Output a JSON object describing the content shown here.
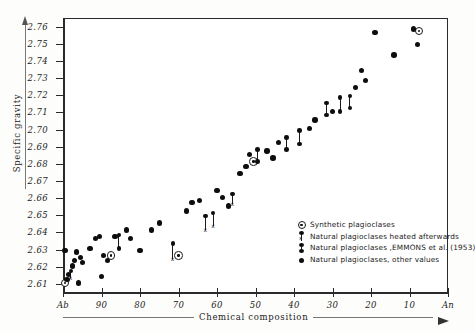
{
  "chart_data": {
    "type": "scatter",
    "title": "",
    "xlabel": "Chemical composition",
    "ylabel": "Specific gravity",
    "x_tick_labels": [
      "Ab",
      "90",
      "80",
      "70",
      "60",
      "50",
      "40",
      "30",
      "20",
      "10",
      "An"
    ],
    "x_tick_values": [
      100,
      90,
      80,
      70,
      60,
      50,
      40,
      30,
      20,
      10,
      0
    ],
    "xlim": [
      100,
      0
    ],
    "x_axis_direction": "decreasing",
    "y_tick_labels": [
      "2.76",
      "2.75",
      "2.74",
      "2.73",
      "2.72",
      "2.71",
      "2.70",
      "2.69",
      "2.68",
      "2.67",
      "2.66",
      "2.65",
      "2.64",
      "2.63",
      "2.62",
      "2.61"
    ],
    "y_tick_values": [
      2.76,
      2.75,
      2.74,
      2.73,
      2.72,
      2.71,
      2.7,
      2.69,
      2.68,
      2.67,
      2.66,
      2.65,
      2.64,
      2.63,
      2.62,
      2.61
    ],
    "ylim": [
      2.605,
      2.765
    ],
    "grid": false,
    "legend_position": "lower-right-inside",
    "legend": [
      {
        "key": "synthetic",
        "label": "Synthetic plagioclases",
        "marker": "open-circle-dot"
      },
      {
        "key": "heated",
        "label": "Natural plagioclases heated afterwards",
        "marker": "dot-bar-x"
      },
      {
        "key": "emmons",
        "label": "Natural plagioclases ,EMMONS et al. (1953)",
        "marker": "dot-bar-dot"
      },
      {
        "key": "other",
        "label": "Natural plagioclases, other values",
        "marker": "filled-circle"
      }
    ],
    "series": [
      {
        "name": "Synthetic plagioclases",
        "key": "synthetic",
        "marker": "open-circle-dot",
        "points": [
          {
            "x": 99.5,
            "y": 2.6105
          },
          {
            "x": 87.5,
            "y": 2.6265
          },
          {
            "x": 70.0,
            "y": 2.6265
          },
          {
            "x": 50.5,
            "y": 2.6815
          },
          {
            "x": 7.5,
            "y": 2.7575
          }
        ]
      },
      {
        "name": "Natural plagioclases heated afterwards",
        "key": "heated",
        "marker": "dot-bar-x",
        "points": [
          {
            "x": 98.0,
            "y": 2.6175,
            "y_low": 2.6135
          },
          {
            "x": 71.5,
            "y": 2.6335,
            "y_low": 2.6245
          },
          {
            "x": 63.0,
            "y": 2.6495,
            "y_low": 2.6415
          },
          {
            "x": 61.0,
            "y": 2.6515,
            "y_low": 2.6435
          },
          {
            "x": 56.0,
            "y": 2.6625,
            "y_low": 2.6565
          }
        ]
      },
      {
        "name": "Natural plagioclases ,EMMONS et al. (1953)",
        "key": "emmons",
        "marker": "dot-bar-dot",
        "points": [
          {
            "x": 85.5,
            "y": 2.6385,
            "y_low": 2.6305
          },
          {
            "x": 49.5,
            "y": 2.6885,
            "y_low": 2.6815
          },
          {
            "x": 42.0,
            "y": 2.6955,
            "y_low": 2.6885
          },
          {
            "x": 38.5,
            "y": 2.6995,
            "y_low": 2.6915
          },
          {
            "x": 31.5,
            "y": 2.7155,
            "y_low": 2.7085
          },
          {
            "x": 28.0,
            "y": 2.7185,
            "y_low": 2.7105
          },
          {
            "x": 25.5,
            "y": 2.7195,
            "y_low": 2.7125
          }
        ]
      },
      {
        "name": "Natural plagioclases, other values",
        "key": "other",
        "marker": "filled-circle",
        "points": [
          {
            "x": 99.0,
            "y": 2.6125
          },
          {
            "x": 98.5,
            "y": 2.6155
          },
          {
            "x": 97.5,
            "y": 2.6205
          },
          {
            "x": 97.0,
            "y": 2.6235
          },
          {
            "x": 99.5,
            "y": 2.6295
          },
          {
            "x": 96.5,
            "y": 2.6285
          },
          {
            "x": 95.5,
            "y": 2.6255
          },
          {
            "x": 95.0,
            "y": 2.6225
          },
          {
            "x": 96.0,
            "y": 2.6105
          },
          {
            "x": 93.0,
            "y": 2.6305
          },
          {
            "x": 91.5,
            "y": 2.6365
          },
          {
            "x": 90.5,
            "y": 2.6375
          },
          {
            "x": 89.5,
            "y": 2.6265
          },
          {
            "x": 88.5,
            "y": 2.6235
          },
          {
            "x": 90.0,
            "y": 2.6145
          },
          {
            "x": 86.5,
            "y": 2.6375
          },
          {
            "x": 83.5,
            "y": 2.6415
          },
          {
            "x": 82.5,
            "y": 2.6365
          },
          {
            "x": 80.0,
            "y": 2.6295
          },
          {
            "x": 77.0,
            "y": 2.6415
          },
          {
            "x": 75.0,
            "y": 2.6455
          },
          {
            "x": 68.0,
            "y": 2.6525
          },
          {
            "x": 66.5,
            "y": 2.6575
          },
          {
            "x": 64.5,
            "y": 2.6585
          },
          {
            "x": 60.0,
            "y": 2.6645
          },
          {
            "x": 58.5,
            "y": 2.6605
          },
          {
            "x": 57.0,
            "y": 2.6555
          },
          {
            "x": 54.0,
            "y": 2.6745
          },
          {
            "x": 52.5,
            "y": 2.6785
          },
          {
            "x": 51.5,
            "y": 2.6855
          },
          {
            "x": 47.0,
            "y": 2.6875
          },
          {
            "x": 45.5,
            "y": 2.6835
          },
          {
            "x": 44.0,
            "y": 2.6925
          },
          {
            "x": 36.0,
            "y": 2.7005
          },
          {
            "x": 34.5,
            "y": 2.7055
          },
          {
            "x": 30.0,
            "y": 2.7105
          },
          {
            "x": 24.0,
            "y": 2.7245
          },
          {
            "x": 22.5,
            "y": 2.7345
          },
          {
            "x": 21.5,
            "y": 2.7285
          },
          {
            "x": 19.0,
            "y": 2.7565
          },
          {
            "x": 14.0,
            "y": 2.7435
          },
          {
            "x": 9.0,
            "y": 2.7585
          },
          {
            "x": 8.0,
            "y": 2.7495
          }
        ]
      }
    ]
  }
}
